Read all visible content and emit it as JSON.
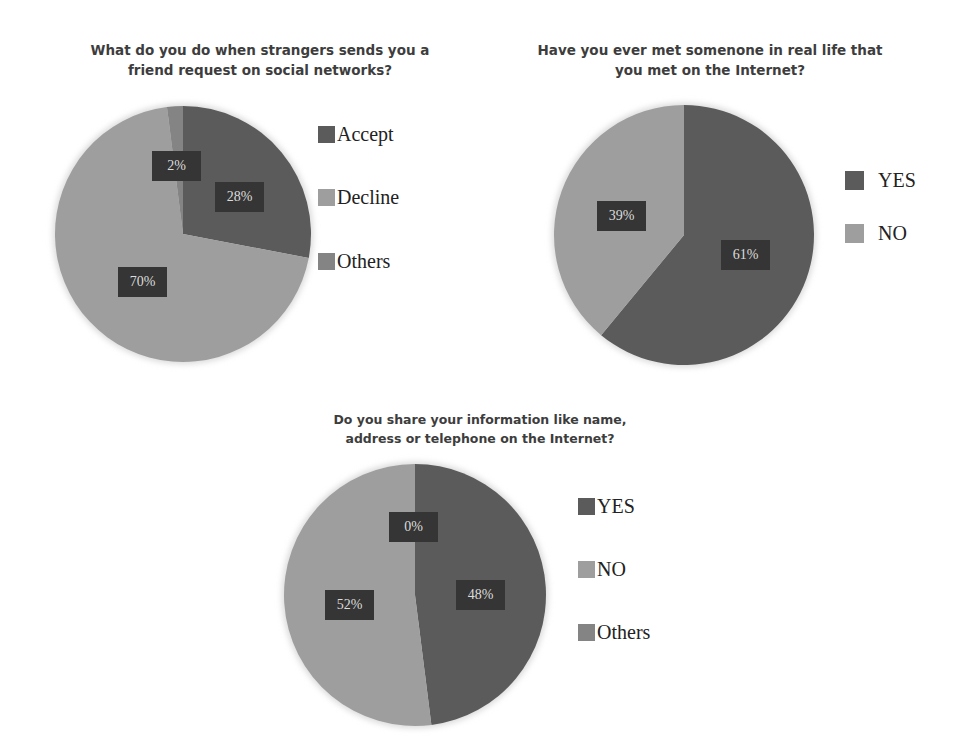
{
  "colors": {
    "dark": "#5b5b5b",
    "light": "#9e9e9e",
    "others": "#848484",
    "label_bg": "#353535",
    "label_text": "#dcdcdc"
  },
  "chart_data": [
    {
      "type": "pie",
      "title": "What do you do when strangers sends you a friend request on social networks?",
      "title_lines": [
        "What do you do when strangers sends you a",
        "friend request on social networks?"
      ],
      "categories": [
        "Accept",
        "Decline",
        "Others"
      ],
      "values": [
        28,
        70,
        2
      ],
      "labels": [
        "28%",
        "70%",
        "2%"
      ],
      "legend_position": "right"
    },
    {
      "type": "pie",
      "title": "Have you ever met somenone in real life that you met on the Internet?",
      "title_lines": [
        "Have you ever met somenone in real life that",
        "you met on the Internet?"
      ],
      "categories": [
        "YES",
        "NO"
      ],
      "values": [
        61,
        39
      ],
      "labels": [
        "61%",
        "39%"
      ],
      "legend_position": "right"
    },
    {
      "type": "pie",
      "title": "Do you share your information like name, address or telephone on the Internet?",
      "title_lines": [
        "Do you share your information like name,",
        "address or telephone on the Internet?"
      ],
      "categories": [
        "YES",
        "NO",
        "Others"
      ],
      "values": [
        48,
        52,
        0
      ],
      "labels": [
        "48%",
        "52%",
        "0%"
      ],
      "legend_position": "right"
    }
  ]
}
